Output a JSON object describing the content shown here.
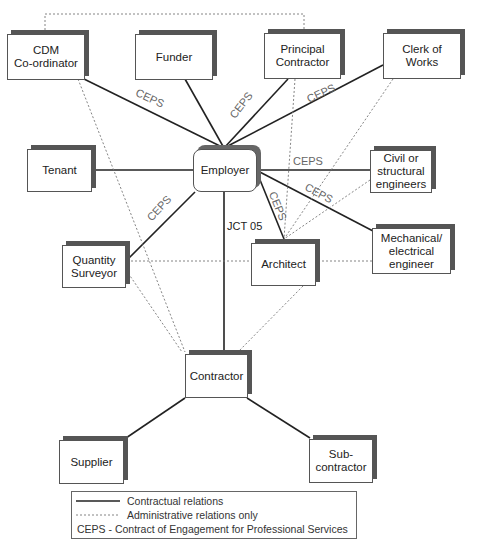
{
  "nodes": {
    "cdm": "CDM\nCo-ordinator",
    "funder": "Funder",
    "principal": "Principal\nContractor",
    "clerk": "Clerk of\nWorks",
    "tenant": "Tenant",
    "employer": "Employer",
    "civil": "Civil or\nstructural\nengineers",
    "qs": "Quantity\nSurveyor",
    "architect": "Architect",
    "mech": "Mechanical/\nelectrical\nengineer",
    "contractor": "Contractor",
    "supplier": "Supplier",
    "sub": "Sub-\ncontractor"
  },
  "edge_labels": {
    "ceps": "CEPS",
    "jct": "JCT 05"
  },
  "legend": {
    "contractual": "Contractual relations",
    "administrative": "Administrative relations only",
    "ceps_def": "CEPS - Contract of Engagement for Professional Services"
  },
  "colors": {
    "line": "#222222",
    "dotted": "#777777",
    "shadow": "#555555"
  }
}
